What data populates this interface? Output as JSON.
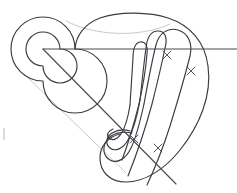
{
  "figure": {
    "width": 237,
    "height": 193,
    "background_color": "#ffffff",
    "stroke_color": "#3b3b42",
    "faint_stroke_color": "#c9c9cc",
    "cross_color": "#55555e"
  },
  "spiral": {
    "name": "left-spiral",
    "center_x": 43,
    "center_y": 49,
    "outer_radius": 32,
    "inner_radius": 17,
    "turns": 2
  },
  "bands": [
    {
      "id": "band-outer",
      "label": "outer band"
    },
    {
      "id": "band-second",
      "label": "second band"
    },
    {
      "id": "band-third",
      "label": "third band"
    },
    {
      "id": "band-inner",
      "label": "inner band"
    }
  ],
  "lines": {
    "horizontal": {
      "label": "horizontal transversal",
      "x1": 43,
      "y1": 49,
      "x2": 237,
      "y2": 49
    },
    "diagonal": {
      "label": "diagonal transversal",
      "x1": 43,
      "y1": 49,
      "x2": 176,
      "y2": 184
    }
  },
  "crosses": [
    {
      "id": "cross-1",
      "label": "x",
      "x": 167,
      "y": 55
    },
    {
      "id": "cross-2",
      "label": "x",
      "x": 191,
      "y": 71
    },
    {
      "id": "cross-3",
      "label": "x",
      "x": 134,
      "y": 139
    },
    {
      "id": "cross-4",
      "label": "x",
      "x": 158,
      "y": 148
    }
  ],
  "edge_marks": [
    {
      "id": "edge-tick-left",
      "x": 4,
      "y": 128,
      "height": 12
    }
  ]
}
